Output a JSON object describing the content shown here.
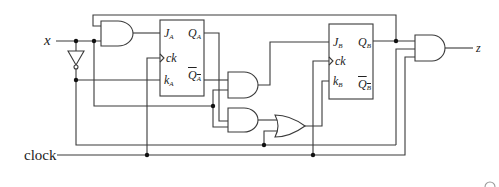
{
  "diagram": {
    "type": "sequential logic circuit",
    "inputs": {
      "x": "x",
      "clock": "clock"
    },
    "output": {
      "z": "z"
    },
    "flip_flops": [
      {
        "id": "A",
        "type": "JK",
        "pins": {
          "j": "J",
          "j_sub": "A",
          "ck": "ck",
          "k": "k",
          "k_sub": "A",
          "q": "Q",
          "q_sub": "A",
          "qbar": "Q",
          "qbar_sub": "A"
        }
      },
      {
        "id": "B",
        "type": "JK",
        "pins": {
          "j": "J",
          "j_sub": "B",
          "ck": "ck",
          "k": "k",
          "k_sub": "B",
          "q": "Q",
          "q_sub": "B",
          "qbar": "Q",
          "qbar_sub": "B"
        }
      }
    ],
    "gates": [
      {
        "id": "and1",
        "type": "AND",
        "inputs": [
          "Q_B",
          "x"
        ],
        "output": "J_A"
      },
      {
        "id": "not1",
        "type": "NOT",
        "inputs": [
          "x"
        ],
        "output": "x'"
      },
      {
        "id": "and2",
        "type": "AND",
        "inputs": [
          "Q_A'",
          "x"
        ],
        "output": "J_B"
      },
      {
        "id": "and3",
        "type": "AND",
        "inputs": [
          "Q_A",
          "x"
        ],
        "output": "or1.in1"
      },
      {
        "id": "or1",
        "type": "OR",
        "inputs": [
          "and3",
          "x'"
        ],
        "output": "K_B"
      },
      {
        "id": "and4",
        "type": "AND",
        "inputs": [
          "Q_B",
          "x'",
          "clock"
        ],
        "output": "z"
      }
    ],
    "colors": {
      "wire": "#3a3a3a",
      "junction": "#111111",
      "background": "#ffffff"
    }
  }
}
